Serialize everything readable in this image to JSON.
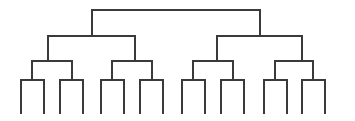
{
  "figure": {
    "type": "dendrogram",
    "background_color": "#ffffff",
    "line_color": "#3a3a3a",
    "line_width": 1.6,
    "width": 355,
    "height": 121,
    "depth_levels": 4,
    "leaf_count": 16,
    "orientation": "top-down"
  },
  "geometry": {
    "level_y": {
      "root_bar": 10,
      "level2_bar": 36,
      "level3_bar": 61,
      "leaf_bar": 80,
      "leaf_bottom": 114
    },
    "root": {
      "x_left": 92,
      "x_right": 260,
      "y": 10
    },
    "level2_bars": [
      {
        "x_left": 48,
        "x_right": 135,
        "y": 36,
        "parent_x": 92
      },
      {
        "x_left": 217,
        "x_right": 302,
        "y": 36,
        "parent_x": 260
      }
    ],
    "level3_bars": [
      {
        "x_left": 32,
        "x_right": 72,
        "y": 61,
        "parent_x": 48
      },
      {
        "x_left": 112,
        "x_right": 152,
        "y": 61,
        "parent_x": 135
      },
      {
        "x_left": 193,
        "x_right": 233,
        "y": 61,
        "parent_x": 217
      },
      {
        "x_left": 275,
        "x_right": 313,
        "y": 61,
        "parent_x": 302
      }
    ],
    "leaf_bars": [
      {
        "x_left": 21,
        "x_right": 44,
        "y": 80,
        "parent_x": 32
      },
      {
        "x_left": 60,
        "x_right": 83,
        "y": 80,
        "parent_x": 72
      },
      {
        "x_left": 101,
        "x_right": 124,
        "y": 80,
        "parent_x": 112
      },
      {
        "x_left": 140,
        "x_right": 163,
        "y": 80,
        "parent_x": 152
      },
      {
        "x_left": 182,
        "x_right": 205,
        "y": 80,
        "parent_x": 193
      },
      {
        "x_left": 221,
        "x_right": 244,
        "y": 80,
        "parent_x": 233
      },
      {
        "x_left": 264,
        "x_right": 287,
        "y": 80,
        "parent_x": 275
      },
      {
        "x_left": 302,
        "x_right": 325,
        "y": 80,
        "parent_x": 313
      }
    ],
    "leaf_tips": [
      21,
      44,
      60,
      83,
      101,
      124,
      140,
      163,
      182,
      205,
      221,
      244,
      264,
      287,
      302,
      325
    ]
  },
  "labels": {
    "root_label": "",
    "leaf_labels": [
      "",
      "",
      "",
      "",
      "",
      "",
      "",
      "",
      "",
      "",
      "",
      "",
      "",
      "",
      "",
      ""
    ]
  }
}
